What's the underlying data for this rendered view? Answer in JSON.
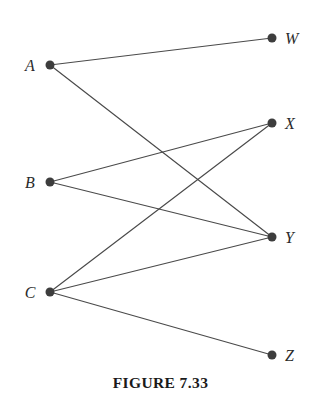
{
  "figure": {
    "caption": "FIGURE 7.33",
    "type": "bipartite-graph-diagram",
    "background_color": "#ffffff",
    "edge_color": "#4a4a4a",
    "vertex_color": "#3d3d3d",
    "label_color": "#2b2b2b"
  },
  "graph": {
    "left_set_name": "A B C",
    "right_set_name": "W X Y Z",
    "vertices": [
      {
        "id": "A",
        "label": "A",
        "x": 50,
        "y": 65,
        "side": "left",
        "label_x": 30,
        "label_y": 71
      },
      {
        "id": "B",
        "label": "B",
        "x": 50,
        "y": 182,
        "side": "left",
        "label_x": 30,
        "label_y": 188
      },
      {
        "id": "C",
        "label": "C",
        "x": 50,
        "y": 292,
        "side": "left",
        "label_x": 30,
        "label_y": 298
      },
      {
        "id": "W",
        "label": "W",
        "x": 272,
        "y": 38,
        "side": "right",
        "label_x": 285,
        "label_y": 44
      },
      {
        "id": "X",
        "label": "X",
        "x": 272,
        "y": 123,
        "side": "right",
        "label_x": 285,
        "label_y": 129
      },
      {
        "id": "Y",
        "label": "Y",
        "x": 272,
        "y": 237,
        "side": "right",
        "label_x": 285,
        "label_y": 243
      },
      {
        "id": "Z",
        "label": "Z",
        "x": 272,
        "y": 355,
        "side": "right",
        "label_x": 285,
        "label_y": 361
      }
    ],
    "vertex_radius": 4.5,
    "edges": [
      {
        "from": "A",
        "to": "W",
        "x1": 50,
        "y1": 65,
        "x2": 272,
        "y2": 38
      },
      {
        "from": "A",
        "to": "Y",
        "x1": 50,
        "y1": 65,
        "x2": 272,
        "y2": 237
      },
      {
        "from": "B",
        "to": "X",
        "x1": 50,
        "y1": 182,
        "x2": 272,
        "y2": 123
      },
      {
        "from": "B",
        "to": "Y",
        "x1": 50,
        "y1": 182,
        "x2": 272,
        "y2": 237
      },
      {
        "from": "C",
        "to": "X",
        "x1": 50,
        "y1": 292,
        "x2": 272,
        "y2": 123
      },
      {
        "from": "C",
        "to": "Y",
        "x1": 50,
        "y1": 292,
        "x2": 272,
        "y2": 237
      },
      {
        "from": "C",
        "to": "Z",
        "x1": 50,
        "y1": 292,
        "x2": 272,
        "y2": 355
      }
    ]
  }
}
